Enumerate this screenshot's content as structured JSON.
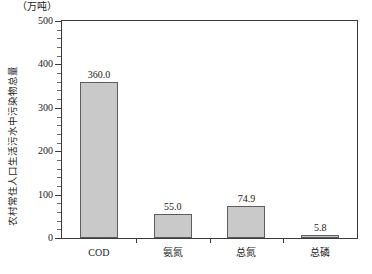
{
  "chart_data": {
    "type": "bar",
    "title": "",
    "subtitle": "",
    "unit_label": "（万吨）",
    "xlabel": "",
    "ylabel": "农村常住人口生活污水中污染物总量",
    "categories": [
      "COD",
      "氨氮",
      "总氮",
      "总磷"
    ],
    "values": [
      360.0,
      55.0,
      74.9,
      5.8
    ],
    "value_labels": [
      "360.0",
      "55.0",
      "74.9",
      "5.8"
    ],
    "ylim": [
      0,
      500
    ],
    "ytick_labels": [
      "0",
      "100",
      "200",
      "300",
      "400",
      "500"
    ],
    "ytick_values": [
      0,
      100,
      200,
      300,
      400,
      500
    ],
    "yminor_step": 20,
    "grid": false,
    "legend": null,
    "series": [
      {
        "name": "农村常住人口生活污水中污染物总量",
        "values": [
          360.0,
          55.0,
          74.9,
          5.8
        ]
      }
    ],
    "colors": {
      "bar_fill": "#c9c9c9",
      "bar_border": "#5d5d5d",
      "axis": "#3a3a3a",
      "text": "#1a1a1a",
      "background": "#ffffff"
    }
  }
}
